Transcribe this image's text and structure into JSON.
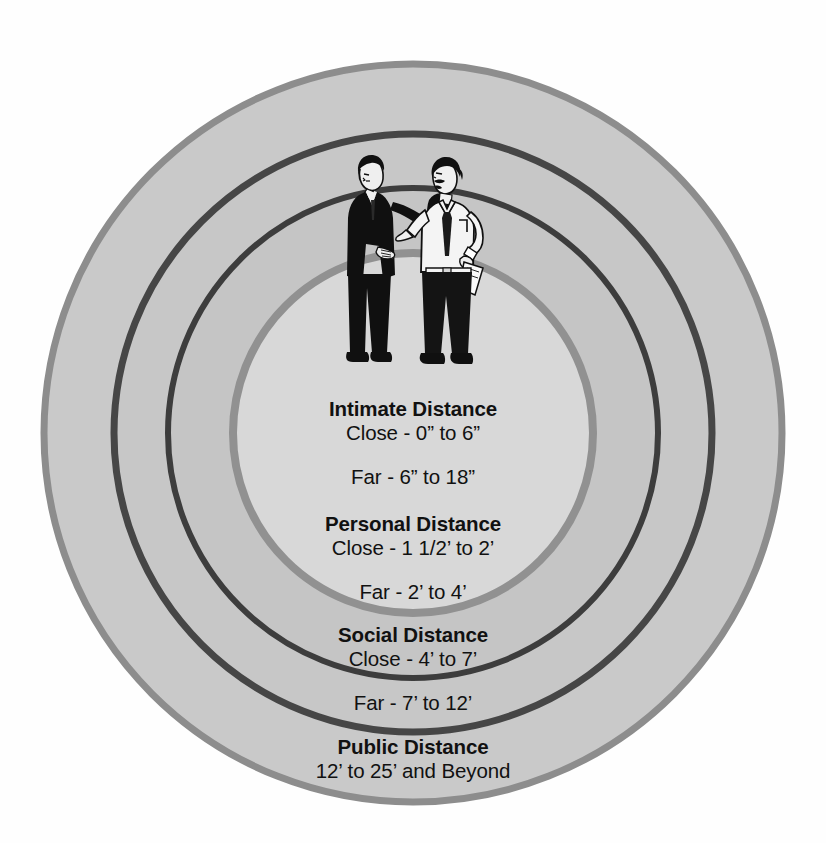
{
  "diagram": {
    "center": {
      "x": 413,
      "y": 433
    },
    "background_color": "#fefefe",
    "zones": [
      {
        "id": "public",
        "name": "Public Distance",
        "title": "Public Distance",
        "close": "",
        "far": "",
        "range": "12’ to 25’ and Beyond",
        "fill_color": "#c8c8c8",
        "ring_color": "#8a8a8a",
        "radius": 372,
        "ring_width": 6
      },
      {
        "id": "social",
        "name": "Social Distance",
        "title": "Social Distance",
        "close": "Close - 4’ to 7’",
        "far": "Far - 7’ to 12’",
        "fill_color": "#c6c6c6",
        "ring_color": "#454545",
        "radius": 300,
        "ring_width": 6
      },
      {
        "id": "personal",
        "name": "Personal Distance",
        "title": "Personal Distance",
        "close": "Close - 1 1/2’ to 2’",
        "far": "Far - 2’ to 4’",
        "fill_color": "#c4c4c4",
        "ring_color": "#3c3c3c",
        "radius": 246,
        "ring_width": 6
      },
      {
        "id": "intimate",
        "name": "Intimate Distance",
        "title": "Intimate Distance",
        "close": "Close - 0” to 6”",
        "far": "Far - 6” to 18”",
        "fill_color": "#d7d7d7",
        "ring_color": "#909090",
        "radius": 181,
        "ring_width": 7
      }
    ],
    "illustration": {
      "name": "two-men-conversing",
      "description": "Two men talking: left man in dark suit with raised hand, right man in white shirt and dark tie holding papers",
      "left_figure": "man-in-dark-suit",
      "right_figure": "man-in-white-shirt-with-tie",
      "suit_color": "#101010",
      "shirt_color": "#f2f2f2",
      "skin_color": "#f0f0f0",
      "outline_color": "#101010"
    },
    "text_color": "#111111"
  }
}
